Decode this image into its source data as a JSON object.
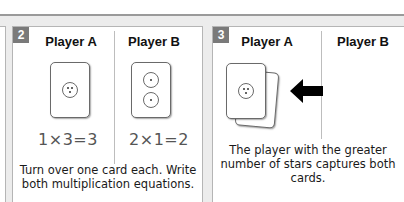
{
  "panels": [
    {
      "number": "2",
      "columns": [
        {
          "header": "Player A",
          "equation": "1×3=3",
          "card_stars": 3
        },
        {
          "header": "Player B",
          "equation": "2×1=2",
          "card_stars": [
            1,
            1
          ]
        }
      ],
      "caption": "Turn over one card each. Write both multiplication equations."
    },
    {
      "number": "3",
      "columns": [
        {
          "header": "Player A"
        },
        {
          "header": "Player B"
        }
      ],
      "caption": "The player with the greater number of stars captures both cards.",
      "arrow": "left-arrow"
    }
  ],
  "colors": {
    "badge": "#7a7a7a",
    "strip": "#ececec",
    "border": "#b5b5b5"
  }
}
